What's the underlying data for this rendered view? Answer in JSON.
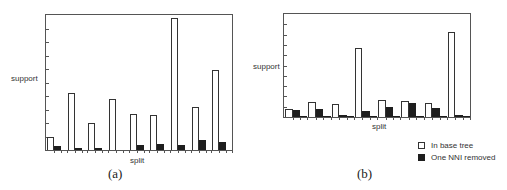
{
  "chart_data": [
    {
      "type": "bar",
      "panel": "(a)",
      "title": "",
      "xlabel": "split",
      "ylabel": "support",
      "ylim": [
        0,
        100
      ],
      "grid": false,
      "categories": [
        "1",
        "2",
        "3",
        "4",
        "5",
        "6",
        "7",
        "8",
        "9"
      ],
      "series": [
        {
          "name": "In base tree",
          "color": "#ffffff",
          "values": [
            10,
            42,
            20,
            38,
            27,
            26,
            98,
            32,
            59
          ]
        },
        {
          "name": "One NNI removed",
          "color": "#1e1e1e",
          "values": [
            3,
            1.5,
            1.5,
            0,
            4,
            4.5,
            4,
            7.5,
            6
          ]
        }
      ]
    },
    {
      "type": "bar",
      "panel": "(b)",
      "title": "",
      "xlabel": "split",
      "ylabel": "support",
      "ylim": [
        0,
        100
      ],
      "grid": false,
      "legend_position": "bottom-right",
      "categories": [
        "1",
        "2",
        "3",
        "4",
        "5",
        "6",
        "7",
        "8"
      ],
      "series": [
        {
          "name": "In base tree",
          "color": "#ffffff",
          "values": [
            8,
            14.5,
            12.5,
            67,
            16.5,
            15.5,
            13.5,
            82.5
          ]
        },
        {
          "name": "One NNI removed",
          "color": "#1e1e1e",
          "values": [
            7,
            8,
            1.5,
            6,
            9.5,
            13.5,
            8.5,
            1.5
          ]
        }
      ]
    }
  ],
  "panel_a": {
    "label": "(a)",
    "ylabel": "support",
    "xlabel": "split"
  },
  "panel_b": {
    "label": "(b)",
    "ylabel": "support",
    "xlabel": "split"
  },
  "legend": {
    "items": [
      {
        "label": "In base tree",
        "swatch": "white"
      },
      {
        "label": "One NNI removed",
        "swatch": "black"
      }
    ]
  }
}
